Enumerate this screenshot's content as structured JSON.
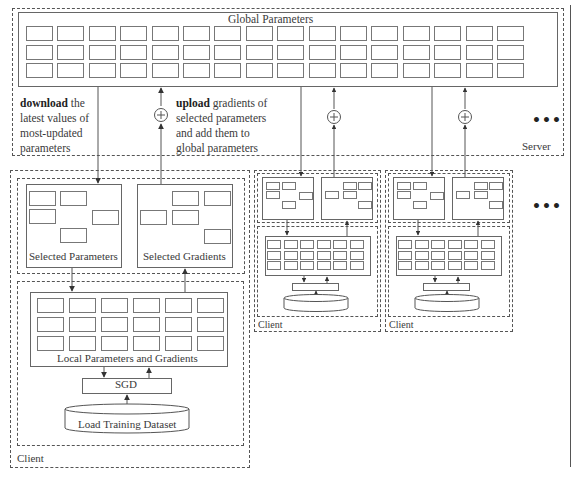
{
  "server": {
    "label": "Server",
    "global_parameters_label": "Global Parameters",
    "grid": {
      "rows": 3,
      "cols": 16
    },
    "download_note": {
      "bold": "download",
      "rest": " the latest values of most-updated parameters",
      "lines": [
        "the",
        "latest values of",
        "most-updated",
        "parameters"
      ]
    },
    "upload_note": {
      "bold": "upload",
      "rest": " gradients of selected parameters and add them to global parameters",
      "lines": [
        "gradients of",
        "selected parameters",
        "and add them to",
        "global parameters"
      ]
    },
    "add_symbol": "+",
    "ellipsis": "•••"
  },
  "clients": [
    {
      "label": "Client",
      "selected_parameters_label": "Selected Parameters",
      "selected_gradients_label": "Selected Gradients",
      "local_label": "Local Parameters and Gradients",
      "sgd_label": "SGD",
      "dataset_label": "Load Training Dataset",
      "local_grid": {
        "rows": 3,
        "cols": 6
      }
    },
    {
      "label": "Client",
      "local_grid": {
        "rows": 3,
        "cols": 6
      }
    },
    {
      "label": "Client",
      "local_grid": {
        "rows": 3,
        "cols": 6
      }
    }
  ],
  "more_clients_ellipsis": "•••",
  "colors": {
    "line": "#555555",
    "box_border": "#666666",
    "text": "#3a3a3a",
    "background": "#ffffff"
  }
}
